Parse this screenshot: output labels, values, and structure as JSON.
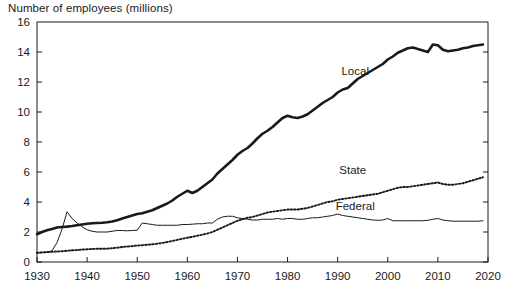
{
  "chart_data": {
    "type": "line",
    "title": "Number of employees (millions)",
    "xlabel": "",
    "ylabel": "Number of employees (millions)",
    "xlim": [
      1930,
      2020
    ],
    "ylim": [
      0,
      16
    ],
    "xticks": [
      1930,
      1940,
      1950,
      1960,
      1970,
      1980,
      1990,
      2000,
      2010,
      2020
    ],
    "xtick_labels": [
      "1930",
      "1940",
      "1950",
      "1960",
      "1970",
      "1980",
      "1990",
      "2000",
      "2010",
      "2020"
    ],
    "yticks": [
      0,
      2,
      4,
      6,
      8,
      10,
      12,
      14,
      16
    ],
    "ytick_labels": [
      "0",
      "2",
      "4",
      "6",
      "8",
      "10",
      "12",
      "14",
      "16"
    ],
    "grid": false,
    "legend_position": "inline-annotations",
    "annotations": [
      {
        "text": "Local",
        "x": 1993.5,
        "y": 12.5
      },
      {
        "text": "State",
        "x": 1993.0,
        "y": 5.9
      },
      {
        "text": "Federal",
        "x": 1993.5,
        "y": 3.45
      }
    ],
    "series": [
      {
        "name": "Local",
        "style": "thick-solid",
        "color": "#1a1a1a",
        "x": [
          1930,
          1931,
          1932,
          1933,
          1934,
          1935,
          1936,
          1937,
          1938,
          1939,
          1940,
          1941,
          1942,
          1943,
          1944,
          1945,
          1946,
          1947,
          1948,
          1949,
          1950,
          1951,
          1952,
          1953,
          1954,
          1955,
          1956,
          1957,
          1958,
          1959,
          1960,
          1961,
          1962,
          1963,
          1964,
          1965,
          1966,
          1967,
          1968,
          1969,
          1970,
          1971,
          1972,
          1973,
          1974,
          1975,
          1976,
          1977,
          1978,
          1979,
          1980,
          1981,
          1982,
          1983,
          1984,
          1985,
          1986,
          1987,
          1988,
          1989,
          1990,
          1991,
          1992,
          1993,
          1994,
          1995,
          1996,
          1997,
          1998,
          1999,
          2000,
          2001,
          2002,
          2003,
          2004,
          2005,
          2006,
          2007,
          2008,
          2009,
          2010,
          2011,
          2012,
          2013,
          2014,
          2015,
          2016,
          2017,
          2018,
          2019
        ],
        "values": [
          1.85,
          2.0,
          2.12,
          2.2,
          2.3,
          2.33,
          2.36,
          2.4,
          2.45,
          2.5,
          2.55,
          2.58,
          2.6,
          2.62,
          2.65,
          2.7,
          2.78,
          2.9,
          3.0,
          3.1,
          3.2,
          3.25,
          3.35,
          3.45,
          3.6,
          3.75,
          3.9,
          4.1,
          4.35,
          4.55,
          4.75,
          4.6,
          4.75,
          5.0,
          5.25,
          5.5,
          5.9,
          6.2,
          6.5,
          6.8,
          7.15,
          7.4,
          7.6,
          7.9,
          8.25,
          8.55,
          8.75,
          9.0,
          9.3,
          9.6,
          9.75,
          9.65,
          9.6,
          9.7,
          9.85,
          10.1,
          10.35,
          10.6,
          10.8,
          11.0,
          11.3,
          11.5,
          11.6,
          11.9,
          12.2,
          12.4,
          12.6,
          12.8,
          13.0,
          13.2,
          13.5,
          13.7,
          13.95,
          14.1,
          14.25,
          14.3,
          14.2,
          14.1,
          14.0,
          14.5,
          14.45,
          14.15,
          14.05,
          14.1,
          14.15,
          14.25,
          14.3,
          14.4,
          14.45,
          14.5
        ]
      },
      {
        "name": "State",
        "style": "dotted",
        "color": "#1a1a1a",
        "x": [
          1930,
          1931,
          1932,
          1933,
          1934,
          1935,
          1936,
          1937,
          1938,
          1939,
          1940,
          1941,
          1942,
          1943,
          1944,
          1945,
          1946,
          1947,
          1948,
          1949,
          1950,
          1951,
          1952,
          1953,
          1954,
          1955,
          1956,
          1957,
          1958,
          1959,
          1960,
          1961,
          1962,
          1963,
          1964,
          1965,
          1966,
          1967,
          1968,
          1969,
          1970,
          1971,
          1972,
          1973,
          1974,
          1975,
          1976,
          1977,
          1978,
          1979,
          1980,
          1981,
          1982,
          1983,
          1984,
          1985,
          1986,
          1987,
          1988,
          1989,
          1990,
          1991,
          1992,
          1993,
          1994,
          1995,
          1996,
          1997,
          1998,
          1999,
          2000,
          2001,
          2002,
          2003,
          2004,
          2005,
          2006,
          2007,
          2008,
          2009,
          2010,
          2011,
          2012,
          2013,
          2014,
          2015,
          2016,
          2017,
          2018,
          2019
        ],
        "values": [
          0.62,
          0.64,
          0.66,
          0.68,
          0.7,
          0.72,
          0.75,
          0.78,
          0.8,
          0.83,
          0.85,
          0.87,
          0.88,
          0.88,
          0.89,
          0.92,
          0.95,
          1.0,
          1.03,
          1.06,
          1.1,
          1.12,
          1.15,
          1.18,
          1.22,
          1.27,
          1.33,
          1.4,
          1.48,
          1.55,
          1.62,
          1.68,
          1.75,
          1.82,
          1.9,
          2.0,
          2.15,
          2.3,
          2.45,
          2.6,
          2.75,
          2.85,
          2.95,
          3.0,
          3.1,
          3.2,
          3.3,
          3.35,
          3.4,
          3.45,
          3.5,
          3.5,
          3.5,
          3.55,
          3.6,
          3.7,
          3.8,
          3.9,
          4.0,
          4.05,
          4.15,
          4.2,
          4.25,
          4.3,
          4.35,
          4.4,
          4.45,
          4.5,
          4.55,
          4.65,
          4.75,
          4.85,
          4.95,
          5.0,
          5.0,
          5.05,
          5.1,
          5.15,
          5.2,
          5.25,
          5.3,
          5.2,
          5.15,
          5.15,
          5.2,
          5.25,
          5.35,
          5.45,
          5.55,
          5.65
        ]
      },
      {
        "name": "Federal",
        "style": "thin-solid",
        "color": "#1a1a1a",
        "x": [
          1930,
          1931,
          1932,
          1933,
          1934,
          1935,
          1936,
          1937,
          1938,
          1939,
          1940,
          1941,
          1942,
          1943,
          1944,
          1945,
          1946,
          1947,
          1948,
          1949,
          1950,
          1951,
          1952,
          1953,
          1954,
          1955,
          1956,
          1957,
          1958,
          1959,
          1960,
          1961,
          1962,
          1963,
          1964,
          1965,
          1966,
          1967,
          1968,
          1969,
          1970,
          1971,
          1972,
          1973,
          1974,
          1975,
          1976,
          1977,
          1978,
          1979,
          1980,
          1981,
          1982,
          1983,
          1984,
          1985,
          1986,
          1987,
          1988,
          1989,
          1990,
          1991,
          1992,
          1993,
          1994,
          1995,
          1996,
          1997,
          1998,
          1999,
          2000,
          2001,
          2002,
          2003,
          2004,
          2005,
          2006,
          2007,
          2008,
          2009,
          2010,
          2011,
          2012,
          2013,
          2014,
          2015,
          2016,
          2017,
          2018,
          2019
        ],
        "values": [
          0.6,
          0.62,
          0.65,
          0.75,
          1.3,
          2.2,
          3.35,
          2.9,
          2.6,
          2.35,
          2.15,
          2.05,
          2.0,
          2.0,
          2.0,
          2.05,
          2.1,
          2.1,
          2.08,
          2.1,
          2.12,
          2.6,
          2.55,
          2.5,
          2.45,
          2.45,
          2.45,
          2.45,
          2.45,
          2.5,
          2.5,
          2.52,
          2.55,
          2.55,
          2.6,
          2.6,
          2.85,
          3.0,
          3.05,
          3.05,
          2.95,
          2.9,
          2.85,
          2.8,
          2.8,
          2.85,
          2.85,
          2.85,
          2.9,
          2.85,
          2.9,
          2.9,
          2.85,
          2.85,
          2.9,
          2.95,
          2.95,
          3.0,
          3.05,
          3.1,
          3.2,
          3.1,
          3.05,
          3.0,
          2.95,
          2.9,
          2.85,
          2.8,
          2.78,
          2.8,
          2.9,
          2.75,
          2.75,
          2.75,
          2.75,
          2.75,
          2.75,
          2.75,
          2.78,
          2.85,
          2.9,
          2.8,
          2.75,
          2.72,
          2.72,
          2.72,
          2.72,
          2.72,
          2.72,
          2.75
        ]
      }
    ]
  },
  "axis": {
    "plot_left": 37,
    "plot_right": 488,
    "plot_top": 22,
    "plot_bottom": 262
  }
}
